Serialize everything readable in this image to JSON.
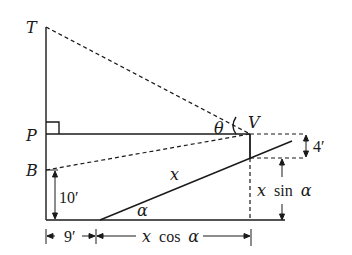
{
  "diagram": {
    "points": {
      "T": "T",
      "P": "P",
      "B": "B",
      "V": "V"
    },
    "angles": {
      "theta": "θ",
      "alpha": "α"
    },
    "labels": {
      "hyp": "x",
      "ten": "10′",
      "nine": "9′",
      "four": "4′",
      "xcos_x": "x",
      "xcos_fn": "cos",
      "xcos_a": "α",
      "xsin_x": "x",
      "xsin_fn": "sin",
      "xsin_a": "α"
    },
    "colors": {
      "stroke": "#1a1a1a",
      "background": "#ffffff"
    }
  }
}
